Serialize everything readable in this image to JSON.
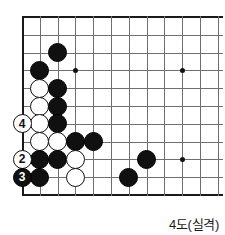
{
  "diagram": {
    "caption": "4도(실격)",
    "board": {
      "cols": 11,
      "rows": 11,
      "cell": 17.8,
      "origin_x": 22,
      "origin_y": 17,
      "edges": [
        "left",
        "top",
        "bottom"
      ],
      "star_points": [
        {
          "col": 3,
          "row": 3
        },
        {
          "col": 9,
          "row": 3
        },
        {
          "col": 9,
          "row": 8
        }
      ]
    },
    "stones": [
      {
        "col": 2,
        "row": 2,
        "color": "black",
        "label": ""
      },
      {
        "col": 1,
        "row": 3,
        "color": "black",
        "label": ""
      },
      {
        "col": 1,
        "row": 4,
        "color": "white",
        "label": ""
      },
      {
        "col": 2,
        "row": 4,
        "color": "black",
        "label": ""
      },
      {
        "col": 1,
        "row": 5,
        "color": "white",
        "label": ""
      },
      {
        "col": 2,
        "row": 5,
        "color": "black",
        "label": ""
      },
      {
        "col": 1,
        "row": 6,
        "color": "white",
        "label": ""
      },
      {
        "col": 2,
        "row": 6,
        "color": "black",
        "label": ""
      },
      {
        "col": 1,
        "row": 7,
        "color": "white",
        "label": ""
      },
      {
        "col": 2,
        "row": 7,
        "color": "white",
        "label": ""
      },
      {
        "col": 3,
        "row": 7,
        "color": "black",
        "label": ""
      },
      {
        "col": 4,
        "row": 7,
        "color": "black",
        "label": ""
      },
      {
        "col": 1,
        "row": 8,
        "color": "black",
        "label": ""
      },
      {
        "col": 2,
        "row": 8,
        "color": "black",
        "label": ""
      },
      {
        "col": 3,
        "row": 8,
        "color": "white",
        "label": ""
      },
      {
        "col": 7,
        "row": 8,
        "color": "black",
        "label": ""
      },
      {
        "col": 1,
        "row": 9,
        "color": "black",
        "label": ""
      },
      {
        "col": 3,
        "row": 9,
        "color": "white",
        "label": ""
      },
      {
        "col": 6,
        "row": 9,
        "color": "black",
        "label": ""
      },
      {
        "col": 0,
        "row": 6,
        "color": "white",
        "label": "4"
      },
      {
        "col": 0,
        "row": 8,
        "color": "white",
        "label": "2"
      },
      {
        "col": 0,
        "row": 9,
        "color": "black",
        "label": "3"
      }
    ]
  }
}
